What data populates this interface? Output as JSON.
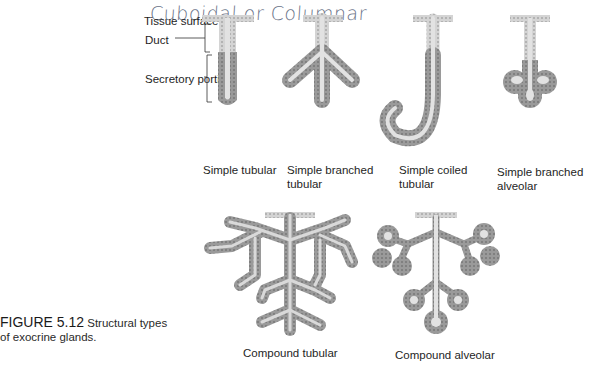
{
  "annotation": {
    "handwritten_note": "Cuboidal or Columnar"
  },
  "labels": {
    "tissue_surface": "Tissue surface",
    "duct": "Duct",
    "secretory_portion": "Secretory portion"
  },
  "glands": [
    {
      "line1": "Simple tubular",
      "line2": ""
    },
    {
      "line1": "Simple branched",
      "line2": "tubular"
    },
    {
      "line1": "Simple coiled",
      "line2": "tubular"
    },
    {
      "line1": "Simple branched",
      "line2": "alveolar"
    },
    {
      "line1": "Compound tubular",
      "line2": ""
    },
    {
      "line1": "Compound alveolar",
      "line2": ""
    }
  ],
  "figure": {
    "number": "FIGURE 5.12",
    "caption_part1": "Structural types",
    "caption_part2": "of exocrine glands."
  },
  "colors": {
    "gland_fill": "#9c9c9c",
    "gland_dark": "#7e7e7e",
    "lumen": "#e4e4e4",
    "duct_cells": "#cfcfcf",
    "handwriting": "#6a7388"
  }
}
